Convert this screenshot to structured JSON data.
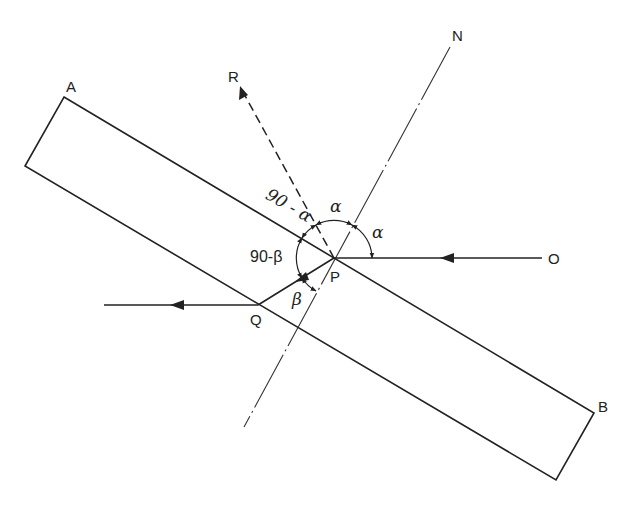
{
  "diagram": {
    "type": "ray-reflection-refraction",
    "points": {
      "A": "A",
      "B": "B",
      "N": "N",
      "R": "R",
      "O": "O",
      "P": "P",
      "Q": "Q"
    },
    "angles": {
      "alpha_top": "α",
      "alpha_right": "α",
      "ninety_minus_alpha": "90 - α",
      "ninety_minus_beta": "90-β",
      "beta": "β"
    },
    "elements": {
      "slab": "rectangular slab AB",
      "normal": "normal line N through P",
      "incident_ray": "ray from O to P",
      "reflected_ray": "dashed ray from P to R",
      "refracted_ray": "ray from P to Q",
      "emergent_ray": "ray leaving Q to the left"
    },
    "colors": {
      "line": "#222222",
      "background": "#ffffff"
    }
  }
}
